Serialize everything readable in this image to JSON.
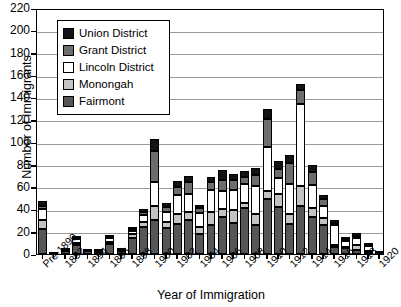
{
  "chart_data": {
    "type": "bar",
    "subtype": "stacked-vertical",
    "title": "",
    "xlabel": "Year of Immigration",
    "ylabel": "Number of Immigrants",
    "ylim": [
      0,
      220
    ],
    "ytick_step": 20,
    "yticks": [
      0,
      20,
      40,
      60,
      80,
      100,
      120,
      140,
      160,
      180,
      200,
      220
    ],
    "grid": true,
    "grid_axis": "y",
    "legend_position": "upper-left-inside",
    "legend": [
      "Union District",
      "Grant District",
      "Lincoln District",
      "Monongah",
      "Fairmont"
    ],
    "colors": {
      "Union District": "#131313",
      "Grant District": "#6d6d6d",
      "Lincoln District": "#ffffff",
      "Monongah": "#c3c3c3",
      "Fairmont": "#565656"
    },
    "categories": [
      "Pre-1890",
      "1891",
      "1892",
      "1893",
      "1894",
      "1895",
      "1896",
      "1897",
      "1898",
      "1899",
      "1900",
      "1901",
      "1902",
      "1903",
      "1904",
      "1905",
      "1906",
      "1907",
      "1908",
      "1909",
      "1910",
      "1911",
      "1912",
      "1913",
      "1914",
      "1915",
      "1916",
      "1917",
      "1918",
      "1919",
      "1920"
    ],
    "tick_labels": [
      "Pre-1890",
      "",
      "1892",
      "",
      "1894",
      "",
      "1896",
      "",
      "1898",
      "",
      "1900",
      "",
      "1902",
      "",
      "1904",
      "",
      "1906",
      "",
      "1908",
      "",
      "1910",
      "",
      "1912",
      "",
      "1914",
      "",
      "1916",
      "",
      "1918",
      "",
      "1920"
    ],
    "series": [
      {
        "name": "Fairmont",
        "values": [
          22,
          1,
          3,
          8,
          3,
          2,
          9,
          3,
          14,
          24,
          30,
          23,
          27,
          30,
          18,
          26,
          33,
          28,
          41,
          26,
          49,
          42,
          27,
          43,
          33,
          26,
          6,
          5,
          4,
          2,
          1
        ]
      },
      {
        "name": "Monongah",
        "values": [
          8,
          0,
          1,
          2,
          0,
          1,
          2,
          1,
          4,
          5,
          13,
          6,
          9,
          8,
          6,
          12,
          7,
          11,
          5,
          10,
          7,
          12,
          9,
          18,
          8,
          6,
          2,
          1,
          4,
          1,
          0
        ]
      },
      {
        "name": "Lincoln District",
        "values": [
          10,
          0,
          1,
          3,
          1,
          1,
          3,
          1,
          3,
          6,
          21,
          9,
          17,
          16,
          13,
          19,
          16,
          18,
          17,
          25,
          40,
          14,
          27,
          73,
          21,
          11,
          18,
          6,
          6,
          4,
          1
        ]
      },
      {
        "name": "Grant District",
        "values": [
          3,
          0,
          0,
          1,
          0,
          0,
          1,
          0,
          1,
          3,
          28,
          4,
          7,
          10,
          4,
          7,
          10,
          9,
          6,
          10,
          25,
          8,
          18,
          13,
          11,
          6,
          2,
          1,
          2,
          1,
          0
        ]
      },
      {
        "name": "Union District",
        "values": [
          4,
          0,
          0,
          1,
          0,
          0,
          1,
          0,
          1,
          2,
          11,
          4,
          5,
          6,
          3,
          5,
          9,
          6,
          5,
          6,
          9,
          7,
          8,
          5,
          7,
          4,
          2,
          1,
          3,
          1,
          0
        ]
      }
    ],
    "totals": [
      47,
      1,
      5,
      15,
      4,
      4,
      16,
      5,
      23,
      40,
      103,
      46,
      65,
      70,
      44,
      69,
      75,
      72,
      74,
      77,
      130,
      83,
      89,
      152,
      80,
      53,
      30,
      14,
      19,
      9,
      2
    ]
  }
}
